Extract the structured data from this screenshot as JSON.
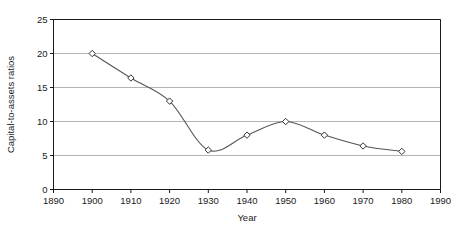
{
  "chart_data": {
    "type": "line",
    "title": "",
    "subtitle": "",
    "xlabel": "Year",
    "ylabel": "Capital-to-assets ratios",
    "xlim": [
      1890,
      1990
    ],
    "ylim": [
      0,
      25
    ],
    "xticks": [
      1890,
      1900,
      1910,
      1920,
      1930,
      1940,
      1950,
      1960,
      1970,
      1980,
      1990
    ],
    "xtick_labels": [
      "1890",
      "1900",
      "1910",
      "1920",
      "1930",
      "1940",
      "1950",
      "1960",
      "1970",
      "1980",
      "1990"
    ],
    "yticks": [
      0,
      5,
      10,
      15,
      20,
      25
    ],
    "ytick_labels": [
      "0",
      "5",
      "10",
      "15",
      "20",
      "25"
    ],
    "grid": "horizontal",
    "legend": "none",
    "marker": "diamond",
    "line_color": "#555555",
    "grid_color": "#aaaaaa",
    "axis_color": "#1a1a1a",
    "marker_fill": "#ffffff",
    "marker_edge": "#333333",
    "x": [
      1900,
      1910,
      1920,
      1930,
      1940,
      1950,
      1960,
      1970,
      1980
    ],
    "values": [
      20.0,
      16.4,
      13.0,
      5.8,
      8.0,
      10.0,
      8.0,
      6.4,
      5.6
    ],
    "series": [
      {
        "name": "Capital-to-assets ratios",
        "x": [
          1900,
          1910,
          1920,
          1930,
          1940,
          1950,
          1960,
          1970,
          1980
        ],
        "values": [
          20.0,
          16.4,
          13.0,
          5.8,
          8.0,
          10.0,
          8.0,
          6.4,
          5.6
        ]
      }
    ],
    "annotations": []
  }
}
